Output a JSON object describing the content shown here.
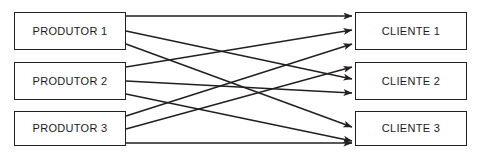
{
  "diagram": {
    "type": "bipartite-flow-diagram",
    "canvas": {
      "width": 479,
      "height": 158,
      "background": "#ffffff"
    },
    "style": {
      "box_border_color": "#231f20",
      "box_fill": "#ffffff",
      "edge_color": "#231f20",
      "text_color": "#1a1a1a"
    },
    "left_column": {
      "name": "producers",
      "nodes": [
        {
          "id": "p1",
          "label": "PRODUTOR 1",
          "x": 14,
          "y": 12,
          "w": 112,
          "h": 38
        },
        {
          "id": "p2",
          "label": "PRODUTOR 2",
          "x": 14,
          "y": 62,
          "w": 112,
          "h": 38
        },
        {
          "id": "p3",
          "label": "PRODUTOR 3",
          "x": 14,
          "y": 111,
          "w": 112,
          "h": 35
        }
      ]
    },
    "right_column": {
      "name": "clients",
      "nodes": [
        {
          "id": "c1",
          "label": "CLIENTE 1",
          "x": 355,
          "y": 12,
          "w": 112,
          "h": 38
        },
        {
          "id": "c2",
          "label": "CLIENTE 2",
          "x": 355,
          "y": 62,
          "w": 112,
          "h": 38
        },
        {
          "id": "c3",
          "label": "CLIENTE 3",
          "x": 355,
          "y": 111,
          "w": 112,
          "h": 35
        }
      ]
    },
    "edges": [
      {
        "id": "e-p1-c1",
        "from": "p1",
        "to": "c1",
        "from_label": "PRODUTOR 1",
        "to_label": "CLIENTE 1",
        "x1": 126,
        "y1": 16,
        "x2": 352,
        "y2": 16,
        "arrow": true
      },
      {
        "id": "e-p1-c2",
        "from": "p1",
        "to": "c2",
        "from_label": "PRODUTOR 1",
        "to_label": "CLIENTE 2",
        "x1": 126,
        "y1": 31,
        "x2": 352,
        "y2": 79,
        "arrow": true
      },
      {
        "id": "e-p1-c3",
        "from": "p1",
        "to": "c3",
        "from_label": "PRODUTOR 1",
        "to_label": "CLIENTE 3",
        "x1": 126,
        "y1": 44,
        "x2": 352,
        "y2": 127,
        "arrow": true
      },
      {
        "id": "e-p2-c1",
        "from": "p2",
        "to": "c1",
        "from_label": "PRODUTOR 2",
        "to_label": "CLIENTE 1",
        "x1": 126,
        "y1": 67,
        "x2": 352,
        "y2": 30,
        "arrow": true
      },
      {
        "id": "e-p2-c2",
        "from": "p2",
        "to": "c2",
        "from_label": "PRODUTOR 2",
        "to_label": "CLIENTE 2",
        "x1": 126,
        "y1": 81,
        "x2": 352,
        "y2": 93,
        "arrow": true
      },
      {
        "id": "e-p2-c3",
        "from": "p2",
        "to": "c3",
        "from_label": "PRODUTOR 2",
        "to_label": "CLIENTE 3",
        "x1": 126,
        "y1": 94,
        "x2": 352,
        "y2": 141,
        "arrow": true
      },
      {
        "id": "e-p3-c1",
        "from": "p3",
        "to": "c1",
        "from_label": "PRODUTOR 3",
        "to_label": "CLIENTE 1",
        "x1": 126,
        "y1": 116,
        "x2": 352,
        "y2": 44,
        "arrow": true
      },
      {
        "id": "e-p3-c2",
        "from": "p3",
        "to": "c2",
        "from_label": "PRODUTOR 3",
        "to_label": "CLIENTE 2",
        "x1": 126,
        "y1": 129,
        "x2": 352,
        "y2": 67,
        "arrow": true
      },
      {
        "id": "e-p3-c3",
        "from": "p3",
        "to": "c3",
        "from_label": "PRODUTOR 3",
        "to_label": "CLIENTE 3",
        "x1": 126,
        "y1": 143,
        "x2": 352,
        "y2": 143,
        "arrow": true
      }
    ]
  }
}
